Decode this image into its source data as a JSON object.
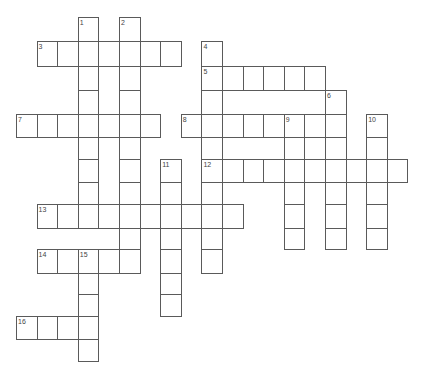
{
  "puzzle": {
    "col_width": 20.6,
    "origin_x": 16,
    "row_tops": [
      17,
      41,
      66,
      90,
      114,
      137,
      159,
      182,
      204,
      228,
      249,
      273,
      294,
      316,
      339,
      361
    ],
    "line_color": "#5a5a5a",
    "number_color": "#444444"
  },
  "entries": [
    {
      "number": "1",
      "direction": "down",
      "row": 0,
      "col": 3,
      "length": 9
    },
    {
      "number": "2",
      "direction": "down",
      "row": 0,
      "col": 5,
      "length": 11
    },
    {
      "number": "3",
      "direction": "across",
      "row": 1,
      "col": 1,
      "length": 7
    },
    {
      "number": "4",
      "direction": "down",
      "row": 1,
      "col": 9,
      "length": 10
    },
    {
      "number": "5",
      "direction": "across",
      "row": 2,
      "col": 9,
      "length": 6
    },
    {
      "number": "6",
      "direction": "down",
      "row": 3,
      "col": 15,
      "length": 7
    },
    {
      "number": "7",
      "direction": "across",
      "row": 4,
      "col": 0,
      "length": 7
    },
    {
      "number": "8",
      "direction": "across",
      "row": 4,
      "col": 8,
      "length": 8
    },
    {
      "number": "9",
      "direction": "down",
      "row": 4,
      "col": 13,
      "length": 6
    },
    {
      "number": "10",
      "direction": "down",
      "row": 4,
      "col": 17,
      "length": 6
    },
    {
      "number": "11",
      "direction": "down",
      "row": 6,
      "col": 7,
      "length": 7
    },
    {
      "number": "12",
      "direction": "across",
      "row": 6,
      "col": 9,
      "length": 10
    },
    {
      "number": "13",
      "direction": "across",
      "row": 8,
      "col": 1,
      "length": 10
    },
    {
      "number": "14",
      "direction": "across",
      "row": 10,
      "col": 1,
      "length": 5
    },
    {
      "number": "15",
      "direction": "down",
      "row": 10,
      "col": 3,
      "length": 5
    },
    {
      "number": "16",
      "direction": "across",
      "row": 13,
      "col": 0,
      "length": 4
    }
  ]
}
